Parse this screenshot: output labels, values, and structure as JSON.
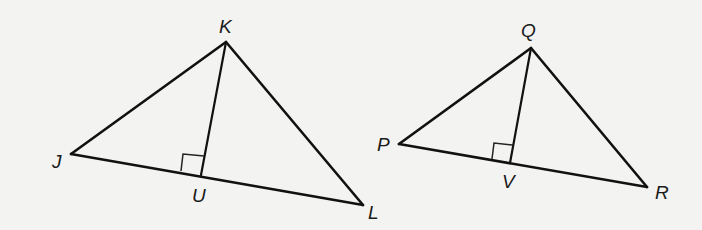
{
  "figure": {
    "background": "#f3f3f1",
    "line_color": "#111111",
    "triangles": [
      {
        "name": "JKL",
        "vertices": {
          "J": {
            "label": "J",
            "x": 71,
            "y": 154,
            "lx": 52,
            "ly": 168
          },
          "K": {
            "label": "K",
            "x": 226,
            "y": 42,
            "lx": 219,
            "ly": 33
          },
          "L": {
            "label": "L",
            "x": 363,
            "y": 205,
            "lx": 368,
            "ly": 219
          }
        },
        "foot": {
          "label": "U",
          "x": 201,
          "y": 175,
          "lx": 192,
          "ly": 202
        },
        "altitude": "KU",
        "right_angle_at": "U"
      },
      {
        "name": "PQR",
        "vertices": {
          "P": {
            "label": "P",
            "x": 399,
            "y": 144,
            "lx": 377,
            "ly": 151
          },
          "Q": {
            "label": "Q",
            "x": 531,
            "y": 48,
            "lx": 521,
            "ly": 37
          },
          "R": {
            "label": "R",
            "x": 647,
            "y": 187,
            "lx": 655,
            "ly": 199
          }
        },
        "foot": {
          "label": "V",
          "x": 510,
          "y": 163,
          "lx": 502,
          "ly": 188
        },
        "altitude": "QV",
        "right_angle_at": "V"
      }
    ]
  }
}
